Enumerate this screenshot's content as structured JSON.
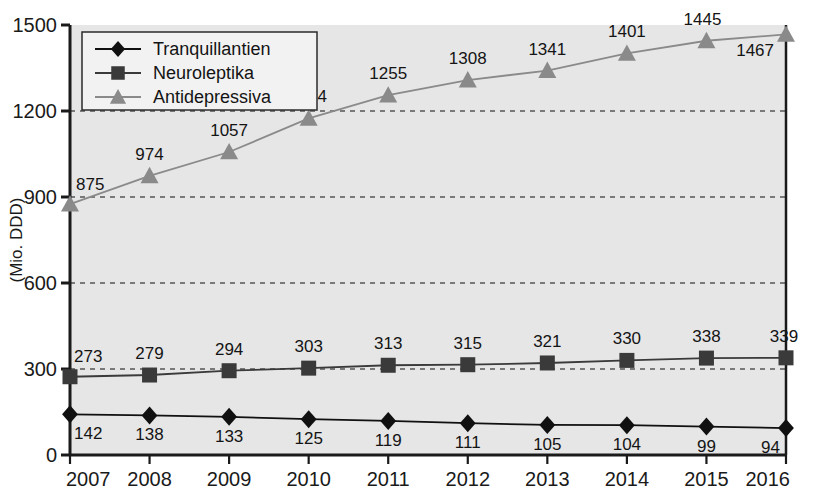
{
  "chart_data": {
    "type": "line",
    "title": "",
    "xlabel": "",
    "ylabel": "(Mio. DDD)",
    "categories": [
      "2007",
      "2008",
      "2009",
      "2010",
      "2011",
      "2012",
      "2013",
      "2014",
      "2015",
      "2016"
    ],
    "ylim": [
      0,
      1500
    ],
    "yticks": [
      "0",
      "300",
      "600",
      "900",
      "1200",
      "1500"
    ],
    "grid": "horizontal-dashed",
    "legend_position": "top-left",
    "series": [
      {
        "name": "Tranquillantien",
        "marker": "diamond",
        "color": "#101010",
        "values": [
          142,
          138,
          133,
          125,
          119,
          111,
          105,
          104,
          99,
          94
        ],
        "label_side": "below"
      },
      {
        "name": "Neuroleptika",
        "marker": "square",
        "color": "#3a3a3a",
        "values": [
          273,
          279,
          294,
          303,
          313,
          315,
          321,
          330,
          338,
          339
        ],
        "label_side": "above"
      },
      {
        "name": "Antidepressiva",
        "marker": "triangle",
        "color": "#8a8a8a",
        "values": [
          875,
          974,
          1057,
          1174,
          1255,
          1308,
          1341,
          1401,
          1445,
          1467
        ],
        "label_side": "above"
      }
    ]
  },
  "colors": {
    "plot_background": "#e6e6e6",
    "page_background": "#ffffff",
    "axis": "#1a1a1a",
    "gridline": "#555555",
    "legend_background": "#f2f2f2",
    "legend_border": "#2b2b2b"
  },
  "legend": {
    "items": [
      {
        "label": "Tranquillantien",
        "marker": "diamond-icon"
      },
      {
        "label": "Neuroleptika",
        "marker": "square-icon"
      },
      {
        "label": "Antidepressiva",
        "marker": "triangle-icon"
      }
    ]
  },
  "axes": {
    "y_title": "(Mio. DDD)",
    "y_ticks": [
      "1500",
      "1200",
      "900",
      "600",
      "300",
      "0"
    ],
    "x_ticks": [
      "2007",
      "2008",
      "2009",
      "2010",
      "2011",
      "2012",
      "2013",
      "2014",
      "2015",
      "2016"
    ]
  }
}
